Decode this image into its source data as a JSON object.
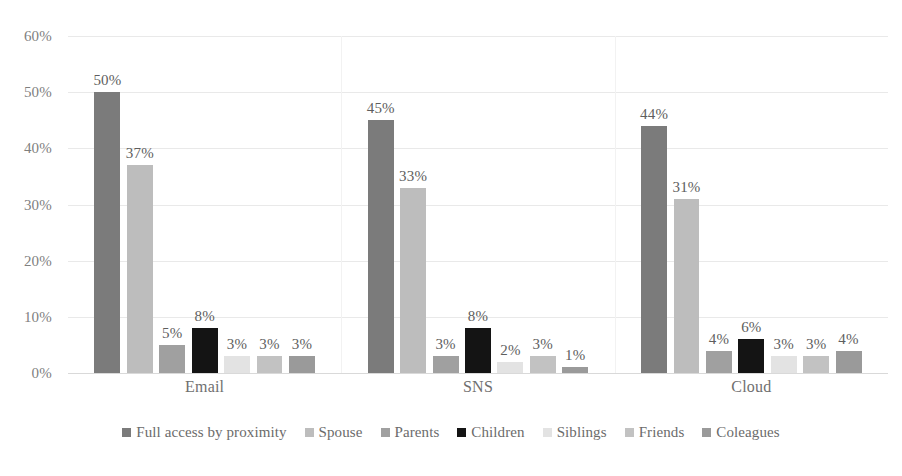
{
  "chart_data": {
    "type": "bar",
    "title": "",
    "subtitle": "",
    "xlabel": "",
    "ylabel": "",
    "categories": [
      "Email",
      "SNS",
      "Cloud"
    ],
    "ylim": [
      0,
      60
    ],
    "yticks": [
      0,
      10,
      20,
      30,
      40,
      50,
      60
    ],
    "ytick_labels": [
      "0%",
      "10%",
      "20%",
      "30%",
      "40%",
      "50%",
      "60%"
    ],
    "value_suffix": "%",
    "grid": true,
    "grid_axis": "y",
    "legend_position": "bottom",
    "series": [
      {
        "name": "Full access by proximity",
        "color": "#7b7b7b",
        "values": [
          50,
          45,
          44
        ],
        "labels": [
          "50%",
          "45%",
          "44%"
        ]
      },
      {
        "name": "Spouse",
        "color": "#bdbdbd",
        "values": [
          37,
          33,
          31
        ],
        "labels": [
          "37%",
          "33%",
          "31%"
        ]
      },
      {
        "name": "Parents",
        "color": "#a0a0a0",
        "values": [
          5,
          3,
          4
        ],
        "labels": [
          "5%",
          "3%",
          "4%"
        ]
      },
      {
        "name": "Children",
        "color": "#141414",
        "values": [
          8,
          8,
          6
        ],
        "labels": [
          "8%",
          "8%",
          "6%"
        ]
      },
      {
        "name": "Siblings",
        "color": "#e3e3e3",
        "values": [
          3,
          2,
          3
        ],
        "labels": [
          "3%",
          "2%",
          "3%"
        ]
      },
      {
        "name": "Friends",
        "color": "#c2c2c2",
        "values": [
          3,
          3,
          3
        ],
        "labels": [
          "3%",
          "3%",
          "3%"
        ]
      },
      {
        "name": "Coleagues",
        "color": "#9a9a9a",
        "values": [
          3,
          1,
          4
        ],
        "labels": [
          "3%",
          "1%",
          "4%"
        ]
      }
    ]
  }
}
